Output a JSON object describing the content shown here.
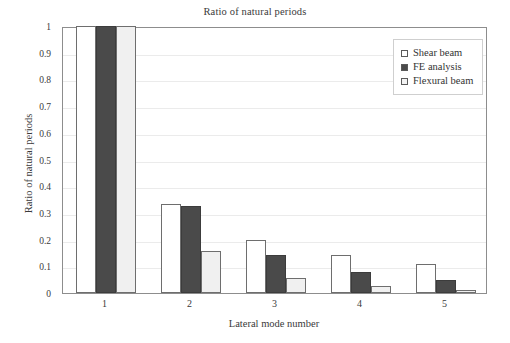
{
  "chart_data": {
    "type": "bar",
    "title": "Ratio of natural periods",
    "xlabel": "Lateral mode number",
    "ylabel": "Ratio of natural periods",
    "categories": [
      "1",
      "2",
      "3",
      "4",
      "5"
    ],
    "ylim": [
      0,
      1
    ],
    "yticks": [
      "0",
      "0.1",
      "0.2",
      "0.3",
      "0.4",
      "0.5",
      "0.6",
      "0.7",
      "0.8",
      "0.9",
      "1"
    ],
    "ytick_values": [
      0,
      0.1,
      0.2,
      0.3,
      0.4,
      0.5,
      0.6,
      0.7,
      0.8,
      0.9,
      1
    ],
    "grid": true,
    "legend_position": "top-right",
    "series": [
      {
        "name": "Shear beam",
        "swatch": "open-square-white",
        "color": "#ffffff",
        "values": [
          1,
          0.335,
          0.199,
          0.141,
          0.108
        ]
      },
      {
        "name": "FE analysis",
        "swatch": "filled-square-dark",
        "color": "#4a4a4a",
        "values": [
          1,
          0.325,
          0.143,
          0.08,
          0.048
        ]
      },
      {
        "name": "Flexural beam",
        "swatch": "open-square-light",
        "color": "#f0f0f0",
        "values": [
          1,
          0.157,
          0.055,
          0.028,
          0.013
        ]
      }
    ]
  }
}
